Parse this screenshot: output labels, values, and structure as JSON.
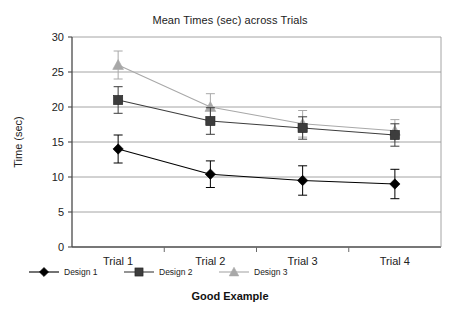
{
  "chart_data": {
    "type": "line",
    "title": "Mean Times (sec) across Trials",
    "xlabel": "Good Example",
    "ylabel": "Time (sec)",
    "categories": [
      "Trial 1",
      "Trial 2",
      "Trial 3",
      "Trial 4"
    ],
    "ylim": [
      0,
      30
    ],
    "yticks": [
      0,
      5,
      10,
      15,
      20,
      25,
      30
    ],
    "grid": "horizontal",
    "legend_position": "bottom",
    "series": [
      {
        "name": "Design 1",
        "marker": "diamond",
        "color": "#000000",
        "values": [
          14.0,
          10.4,
          9.5,
          9.0
        ],
        "errors": [
          2.0,
          1.9,
          2.1,
          2.1
        ]
      },
      {
        "name": "Design 2",
        "marker": "square",
        "color": "#3d3d3d",
        "values": [
          21.0,
          18.0,
          17.0,
          16.0
        ],
        "errors": [
          1.9,
          1.9,
          1.6,
          1.6
        ]
      },
      {
        "name": "Design 3",
        "marker": "triangle",
        "color": "#a8a8a8",
        "values": [
          26.0,
          20.0,
          17.6,
          16.6
        ],
        "errors": [
          2.0,
          1.9,
          1.9,
          1.6
        ]
      }
    ]
  },
  "colors": {
    "axis": "#5a5a5a",
    "grid": "#9a9a9a",
    "text": "#222222"
  }
}
